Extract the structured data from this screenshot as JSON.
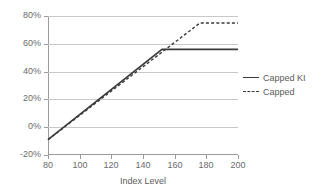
{
  "chart_data": {
    "type": "line",
    "title": "",
    "xlabel": "Index Level",
    "ylabel": "",
    "xlim": [
      80,
      200
    ],
    "ylim": [
      -20,
      80
    ],
    "xticks": [
      80,
      100,
      120,
      140,
      160,
      180,
      200
    ],
    "xtick_labels": [
      "80",
      "100",
      "120",
      "140",
      "160",
      "180",
      "200"
    ],
    "yticks": [
      -20,
      0,
      20,
      40,
      60,
      80
    ],
    "ytick_labels": [
      "-20%",
      "0%",
      "20%",
      "40%",
      "60%",
      "80%"
    ],
    "grid": "horizontal",
    "legend_position": "right",
    "series": [
      {
        "name": "Capped KI",
        "style": "solid",
        "color": "#3a3a3a",
        "cap_value": 56,
        "cap_x": 152,
        "points": [
          {
            "x": 80,
            "y": -9
          },
          {
            "x": 152,
            "y": 56
          },
          {
            "x": 200,
            "y": 56
          }
        ]
      },
      {
        "name": "Capped",
        "style": "dotted",
        "color": "#3a3a3a",
        "cap_value": 75,
        "cap_x": 176,
        "points": [
          {
            "x": 80,
            "y": -9
          },
          {
            "x": 176,
            "y": 75
          },
          {
            "x": 200,
            "y": 75
          }
        ]
      }
    ]
  },
  "axis": {
    "x_title": "Index Level",
    "x_tick_labels": [
      "80",
      "100",
      "120",
      "140",
      "160",
      "180",
      "200"
    ],
    "y_tick_labels": [
      "80%",
      "60%",
      "40%",
      "20%",
      "0%",
      "-20%"
    ]
  },
  "legend": {
    "items": [
      {
        "label": "Capped KI",
        "style": "solid"
      },
      {
        "label": "Capped",
        "style": "dotted"
      }
    ]
  },
  "colors": {
    "series_line": "#3a3a3a",
    "gridline": "#c8c8c8",
    "axis": "#9a9a9a",
    "text": "#5a5a5a",
    "background": "#ffffff"
  }
}
